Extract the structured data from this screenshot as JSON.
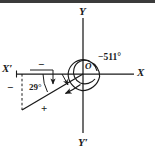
{
  "figure": {
    "colors": {
      "line": "#1a1a1a",
      "background": "#ffffff",
      "border": "#3b3b3b",
      "dashed": "#1a1a1a"
    },
    "axes": {
      "x_positive_label": "X",
      "x_negative_label": "X′",
      "y_positive_label": "Y",
      "y_negative_label": "Y′",
      "origin_label": "O"
    },
    "annotations": {
      "angle_measure": "−511°",
      "reference_angle": "29°",
      "sign_negative_top": "−",
      "sign_negative_left": "−",
      "sign_positive_bottom": "+"
    },
    "geometry": {
      "origin_x": 83,
      "origin_y": 74,
      "reference_angle_degrees": 29,
      "total_angle_degrees": -511,
      "spiral_turns": 1.42
    }
  }
}
